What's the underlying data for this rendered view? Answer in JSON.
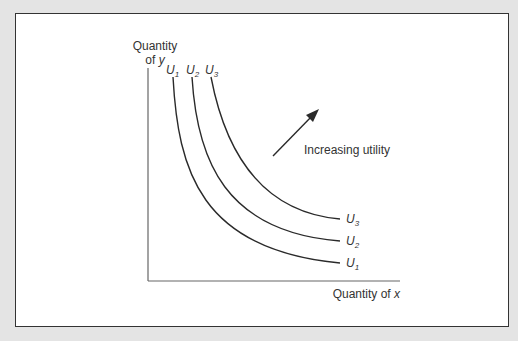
{
  "diagram": {
    "type": "indifference-curves",
    "y_axis_label_line1": "Quantity",
    "y_axis_label_line2_prefix": "of ",
    "y_axis_label_var": "y",
    "x_axis_label_prefix": "Quantity of ",
    "x_axis_label_var": "x",
    "arrow_label": "Increasing utility",
    "curves": [
      {
        "name": "U",
        "sub": "1"
      },
      {
        "name": "U",
        "sub": "2"
      },
      {
        "name": "U",
        "sub": "3"
      }
    ],
    "colors": {
      "line": "#2a2a2a",
      "axis": "#555555",
      "background": "#ffffff",
      "frame": "#e4e4e4"
    }
  }
}
